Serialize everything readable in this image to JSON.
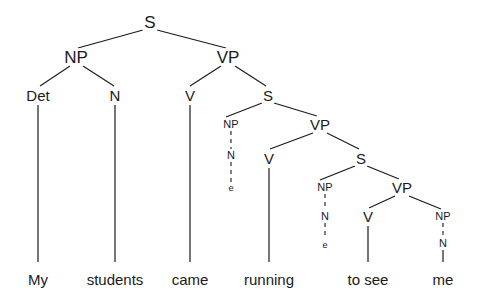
{
  "figure": {
    "sentence": "My students came running to see me",
    "background_color": "#ffffff",
    "line_color": "#1a1a1a",
    "text_color": "#1a1a1a"
  },
  "nodes": [
    {
      "id": "S1",
      "label": "S",
      "x": 150,
      "y": 22,
      "size": "lvl-big"
    },
    {
      "id": "NP1",
      "label": "NP",
      "x": 76,
      "y": 57,
      "size": "lvl-big"
    },
    {
      "id": "VP1",
      "label": "VP",
      "x": 228,
      "y": 57,
      "size": "lvl-big"
    },
    {
      "id": "Det1",
      "label": "Det",
      "x": 38,
      "y": 95,
      "size": "lvl-mid"
    },
    {
      "id": "N1",
      "label": "N",
      "x": 115,
      "y": 95,
      "size": "lvl-mid"
    },
    {
      "id": "V1",
      "label": "V",
      "x": 190,
      "y": 95,
      "size": "lvl-mid"
    },
    {
      "id": "S2",
      "label": "S",
      "x": 268,
      "y": 95,
      "size": "lvl-mid"
    },
    {
      "id": "NP2",
      "label": "NP",
      "x": 231,
      "y": 124,
      "size": "lvl-small"
    },
    {
      "id": "VP2",
      "label": "VP",
      "x": 320,
      "y": 124,
      "size": "lvl-mid"
    },
    {
      "id": "N2",
      "label": "N",
      "x": 231,
      "y": 155,
      "size": "lvl-small"
    },
    {
      "id": "e1",
      "label": "e",
      "x": 231,
      "y": 188,
      "size": "lvl-tiny"
    },
    {
      "id": "V2",
      "label": "V",
      "x": 269,
      "y": 158,
      "size": "lvl-mid"
    },
    {
      "id": "S3",
      "label": "S",
      "x": 361,
      "y": 158,
      "size": "lvl-mid"
    },
    {
      "id": "NP3",
      "label": "NP",
      "x": 325,
      "y": 187,
      "size": "lvl-small"
    },
    {
      "id": "VP3",
      "label": "VP",
      "x": 402,
      "y": 187,
      "size": "lvl-mid"
    },
    {
      "id": "N3",
      "label": "N",
      "x": 325,
      "y": 216,
      "size": "lvl-small"
    },
    {
      "id": "e2",
      "label": "e",
      "x": 325,
      "y": 245,
      "size": "lvl-tiny"
    },
    {
      "id": "V3",
      "label": "V",
      "x": 368,
      "y": 216,
      "size": "lvl-mid"
    },
    {
      "id": "NP4",
      "label": "NP",
      "x": 443,
      "y": 216,
      "size": "lvl-small"
    },
    {
      "id": "N4",
      "label": "N",
      "x": 443,
      "y": 243,
      "size": "lvl-small"
    }
  ],
  "edges": [
    {
      "from": "S1",
      "to": "NP1",
      "style": "solid",
      "x1": 143,
      "y1": 30,
      "x2": 78,
      "y2": 48
    },
    {
      "from": "S1",
      "to": "VP1",
      "style": "solid",
      "x1": 157,
      "y1": 30,
      "x2": 226,
      "y2": 48
    },
    {
      "from": "NP1",
      "to": "Det1",
      "style": "solid",
      "x1": 70,
      "y1": 66,
      "x2": 40,
      "y2": 86
    },
    {
      "from": "NP1",
      "to": "N1",
      "style": "solid",
      "x1": 83,
      "y1": 66,
      "x2": 114,
      "y2": 86
    },
    {
      "from": "VP1",
      "to": "V1",
      "style": "solid",
      "x1": 221,
      "y1": 66,
      "x2": 190,
      "y2": 86
    },
    {
      "from": "VP1",
      "to": "S2",
      "style": "solid",
      "x1": 235,
      "y1": 66,
      "x2": 266,
      "y2": 86
    },
    {
      "from": "Det1",
      "to": "My",
      "style": "solid",
      "x1": 38,
      "y1": 105,
      "x2": 38,
      "y2": 262
    },
    {
      "from": "N1",
      "to": "students",
      "style": "solid",
      "x1": 115,
      "y1": 105,
      "x2": 115,
      "y2": 262
    },
    {
      "from": "V1",
      "to": "came",
      "style": "solid",
      "x1": 190,
      "y1": 105,
      "x2": 190,
      "y2": 262
    },
    {
      "from": "S2",
      "to": "NP2",
      "style": "solid",
      "x1": 262,
      "y1": 103,
      "x2": 226,
      "y2": 117
    },
    {
      "from": "S2",
      "to": "VP2",
      "style": "solid",
      "x1": 274,
      "y1": 103,
      "x2": 317,
      "y2": 116
    },
    {
      "from": "NP2",
      "to": "N2",
      "style": "dashed",
      "x1": 231,
      "y1": 131,
      "x2": 231,
      "y2": 149
    },
    {
      "from": "N2",
      "to": "e1",
      "style": "dashed",
      "x1": 231,
      "y1": 162,
      "x2": 231,
      "y2": 182
    },
    {
      "from": "VP2",
      "to": "V2",
      "style": "solid",
      "x1": 313,
      "y1": 133,
      "x2": 270,
      "y2": 149
    },
    {
      "from": "VP2",
      "to": "S3",
      "style": "solid",
      "x1": 327,
      "y1": 133,
      "x2": 359,
      "y2": 149
    },
    {
      "from": "V2",
      "to": "running",
      "style": "solid",
      "x1": 269,
      "y1": 168,
      "x2": 269,
      "y2": 262
    },
    {
      "from": "S3",
      "to": "NP3",
      "style": "solid",
      "x1": 355,
      "y1": 166,
      "x2": 320,
      "y2": 180
    },
    {
      "from": "S3",
      "to": "VP3",
      "style": "solid",
      "x1": 367,
      "y1": 166,
      "x2": 399,
      "y2": 179
    },
    {
      "from": "NP3",
      "to": "N3",
      "style": "dashed",
      "x1": 325,
      "y1": 194,
      "x2": 325,
      "y2": 210
    },
    {
      "from": "N3",
      "to": "e2",
      "style": "dashed",
      "x1": 325,
      "y1": 223,
      "x2": 325,
      "y2": 239
    },
    {
      "from": "VP3",
      "to": "V3",
      "style": "solid",
      "x1": 395,
      "y1": 196,
      "x2": 369,
      "y2": 208
    },
    {
      "from": "VP3",
      "to": "NP4",
      "style": "solid",
      "x1": 409,
      "y1": 196,
      "x2": 441,
      "y2": 209
    },
    {
      "from": "V3",
      "to": "to-see",
      "style": "solid",
      "x1": 368,
      "y1": 226,
      "x2": 368,
      "y2": 262
    },
    {
      "from": "NP4",
      "to": "N4",
      "style": "dashed",
      "x1": 443,
      "y1": 223,
      "x2": 443,
      "y2": 237
    },
    {
      "from": "N4",
      "to": "me",
      "style": "solid",
      "x1": 443,
      "y1": 250,
      "x2": 443,
      "y2": 262
    }
  ],
  "terminals": [
    {
      "id": "My",
      "label": "My",
      "x": 38,
      "y": 272
    },
    {
      "id": "students",
      "label": "students",
      "x": 115,
      "y": 272
    },
    {
      "id": "came",
      "label": "came",
      "x": 190,
      "y": 272
    },
    {
      "id": "running",
      "label": "running",
      "x": 269,
      "y": 272
    },
    {
      "id": "to-see",
      "label": "to see",
      "x": 368,
      "y": 272
    },
    {
      "id": "me",
      "label": "me",
      "x": 443,
      "y": 272
    }
  ]
}
